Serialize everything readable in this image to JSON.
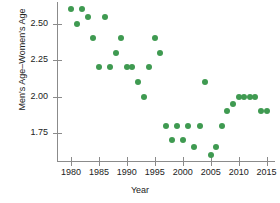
{
  "chart_data": {
    "type": "scatter",
    "title": "",
    "xlabel": "Year",
    "ylabel": "Men's Age–Women's Age",
    "xlim": [
      1977.5,
      2016.5
    ],
    "ylim": [
      1.55,
      2.65
    ],
    "grid": false,
    "legend": "none",
    "point_color": "#3f9a51",
    "axis_color": "#8b8b8b",
    "x_ticks": [
      1980,
      1985,
      1990,
      1995,
      2000,
      2005,
      2010,
      2015
    ],
    "x_tick_labels": [
      "1980",
      "1985",
      "1990",
      "1995",
      "2000",
      "2005",
      "2010",
      "2015"
    ],
    "y_ticks": [
      2.5,
      2.25,
      2.0,
      1.75
    ],
    "y_tick_labels": [
      "2.50",
      "2.25",
      "2.00",
      "1.75"
    ],
    "x": [
      1980,
      1981,
      1982,
      1983,
      1984,
      1985,
      1986,
      1987,
      1988,
      1989,
      1990,
      1991,
      1992,
      1993,
      1994,
      1995,
      1996,
      1997,
      1998,
      1999,
      2000,
      2001,
      2002,
      2003,
      2004,
      2005,
      2006,
      2007,
      2008,
      2009,
      2010,
      2011,
      2012,
      2013,
      2014,
      2015
    ],
    "y": [
      2.6,
      2.5,
      2.6,
      2.55,
      2.4,
      2.2,
      2.55,
      2.2,
      2.3,
      2.4,
      2.2,
      2.2,
      2.1,
      2.0,
      2.2,
      2.4,
      2.3,
      1.8,
      1.7,
      1.8,
      1.7,
      1.8,
      1.65,
      1.8,
      2.1,
      1.6,
      1.65,
      1.8,
      1.9,
      1.95,
      2.0,
      2.0,
      2.0,
      2.0,
      1.9,
      1.9
    ],
    "points": [
      {
        "x": 1980,
        "y": 2.6
      },
      {
        "x": 1981,
        "y": 2.5
      },
      {
        "x": 1982,
        "y": 2.6
      },
      {
        "x": 1983,
        "y": 2.55
      },
      {
        "x": 1984,
        "y": 2.4
      },
      {
        "x": 1985,
        "y": 2.2
      },
      {
        "x": 1986,
        "y": 2.55
      },
      {
        "x": 1987,
        "y": 2.2
      },
      {
        "x": 1988,
        "y": 2.3
      },
      {
        "x": 1989,
        "y": 2.4
      },
      {
        "x": 1990,
        "y": 2.2
      },
      {
        "x": 1991,
        "y": 2.2
      },
      {
        "x": 1992,
        "y": 2.1
      },
      {
        "x": 1993,
        "y": 2.0
      },
      {
        "x": 1994,
        "y": 2.2
      },
      {
        "x": 1995,
        "y": 2.4
      },
      {
        "x": 1996,
        "y": 2.3
      },
      {
        "x": 1997,
        "y": 1.8
      },
      {
        "x": 1998,
        "y": 1.7
      },
      {
        "x": 1999,
        "y": 1.8
      },
      {
        "x": 2000,
        "y": 1.7
      },
      {
        "x": 2001,
        "y": 1.8
      },
      {
        "x": 2002,
        "y": 1.65
      },
      {
        "x": 2003,
        "y": 1.8
      },
      {
        "x": 2004,
        "y": 2.1
      },
      {
        "x": 2005,
        "y": 1.6
      },
      {
        "x": 2006,
        "y": 1.65
      },
      {
        "x": 2007,
        "y": 1.8
      },
      {
        "x": 2008,
        "y": 1.9
      },
      {
        "x": 2009,
        "y": 1.95
      },
      {
        "x": 2010,
        "y": 2.0
      },
      {
        "x": 2011,
        "y": 2.0
      },
      {
        "x": 2012,
        "y": 2.0
      },
      {
        "x": 2013,
        "y": 2.0
      },
      {
        "x": 2014,
        "y": 1.9
      },
      {
        "x": 2015,
        "y": 1.9
      }
    ]
  }
}
